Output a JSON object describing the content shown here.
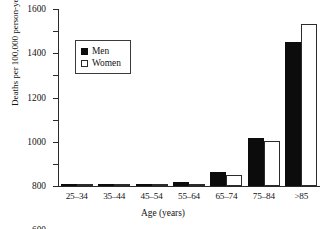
{
  "chart_data": {
    "type": "bar",
    "title": "",
    "xlabel": "Age (years)",
    "ylabel": "Deaths per 100,000 person-years",
    "categories": [
      "25–34",
      "35–44",
      "45–54",
      "55–64",
      "65–74",
      "75–84",
      ">85"
    ],
    "series": [
      {
        "name": "Men",
        "color": "#0c0c0c",
        "fill": "solid",
        "values": [
          3,
          5,
          15,
          40,
          130,
          435,
          1300
        ]
      },
      {
        "name": "Women",
        "color": "#ffffff",
        "fill": "outline",
        "values": [
          2,
          3,
          8,
          22,
          100,
          410,
          1465
        ]
      }
    ],
    "ylim": [
      0,
      1600
    ],
    "yticks": [
      0,
      200,
      400,
      600,
      800,
      1000,
      1200,
      1400,
      1600
    ],
    "ytick_labels": [
      "0",
      "200",
      "400",
      "600",
      "800",
      "1000",
      "1200",
      "1400",
      "1600"
    ],
    "grid": false,
    "legend_position": "upper-left-inside",
    "legend_entries": [
      "Men",
      "Women"
    ]
  }
}
